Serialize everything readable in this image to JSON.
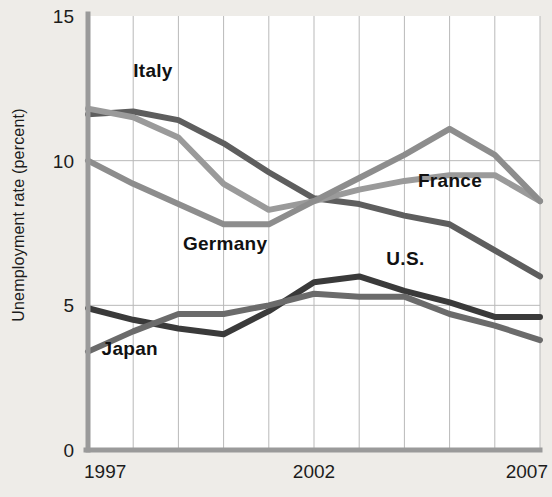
{
  "chart_data": {
    "type": "line",
    "title": "",
    "xlabel": "",
    "ylabel": "Unemployment rate (percent)",
    "xlim": [
      1997,
      2007
    ],
    "ylim": [
      0,
      15
    ],
    "yticks": [
      0,
      5,
      10,
      15
    ],
    "ytick_labels": [
      "0",
      "5",
      "10",
      "15"
    ],
    "xticks": [
      1997,
      2002,
      2007
    ],
    "xtick_labels": [
      "1997",
      "2002",
      "2007"
    ],
    "grid": "vertical gridlines every year; horizontal gridlines at 5 and 10",
    "legend": "inline labels on plot",
    "x": [
      1997,
      1998,
      1999,
      2000,
      2001,
      2002,
      2003,
      2004,
      2005,
      2006,
      2007
    ],
    "series": [
      {
        "name": "Italy",
        "color": "#5e5e5e",
        "label": "Italy",
        "label_x": 1998.0,
        "label_y": 12.9,
        "values": [
          11.6,
          11.7,
          11.4,
          10.6,
          9.6,
          8.7,
          8.5,
          8.1,
          7.8,
          6.9,
          6.0
        ]
      },
      {
        "name": "France",
        "color": "#9a9a9a",
        "label": "France",
        "label_x": 2004.3,
        "label_y": 9.1,
        "values": [
          11.8,
          11.5,
          10.8,
          9.2,
          8.3,
          8.6,
          9.0,
          9.3,
          9.5,
          9.5,
          8.6
        ]
      },
      {
        "name": "Germany",
        "color": "#8d8d8d",
        "label": "Germany",
        "label_x": 1999.1,
        "label_y": 6.9,
        "values": [
          10.0,
          9.2,
          8.5,
          7.8,
          7.8,
          8.6,
          9.4,
          10.2,
          11.1,
          10.2,
          8.6
        ]
      },
      {
        "name": "U.S.",
        "color": "#3a3a3a",
        "label": "U.S.",
        "label_x": 2003.6,
        "label_y": 6.4,
        "values": [
          4.9,
          4.5,
          4.2,
          4.0,
          4.8,
          5.8,
          6.0,
          5.5,
          5.1,
          4.6,
          4.6
        ]
      },
      {
        "name": "Japan",
        "color": "#6b6b6b",
        "label": "Japan",
        "label_x": 1997.3,
        "label_y": 3.3,
        "values": [
          3.4,
          4.1,
          4.7,
          4.7,
          5.0,
          5.4,
          5.3,
          5.3,
          4.7,
          4.3,
          3.8
        ]
      }
    ]
  }
}
